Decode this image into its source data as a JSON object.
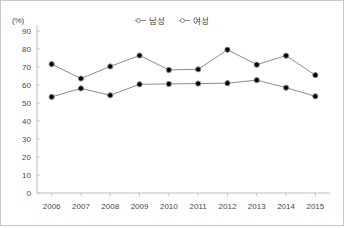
{
  "figure": {
    "unit_label": "(%)",
    "axis_color": "#bfbfbf",
    "series_color": "#8c8c8c",
    "border_color": "#c9c9c9"
  },
  "legend": {
    "position": "top-center",
    "entries": [
      {
        "label": "남성",
        "marker": "open-circle",
        "color": "#8c8c8c"
      },
      {
        "label": "여성",
        "marker": "open-circle",
        "color": "#8c8c8c"
      }
    ]
  },
  "chart_data": {
    "type": "line",
    "title": "",
    "xlabel": "",
    "ylabel": "(%)",
    "categories": [
      "2006",
      "2007",
      "2008",
      "2009",
      "2010",
      "2011",
      "2012",
      "2013",
      "2014",
      "2015"
    ],
    "x": [
      2006,
      2007,
      2008,
      2009,
      2010,
      2011,
      2012,
      2013,
      2014,
      2015
    ],
    "series": [
      {
        "name": "남성",
        "color": "#8c8c8c",
        "marker": "open-circle",
        "values": [
          71.6,
          63.6,
          70.3,
          76.4,
          68.4,
          68.7,
          79.6,
          71.3,
          76.3,
          65.5
        ]
      },
      {
        "name": "여성",
        "color": "#8c8c8c",
        "marker": "open-circle",
        "values": [
          53.4,
          58.1,
          54.3,
          60.4,
          60.6,
          60.8,
          61.0,
          62.7,
          58.5,
          53.7
        ]
      }
    ],
    "ylim": [
      0,
      90
    ],
    "yticks": [
      0,
      10,
      20,
      30,
      40,
      50,
      60,
      70,
      80,
      90
    ],
    "ytick_labels": [
      "0",
      "10",
      "20",
      "30",
      "40",
      "50",
      "60",
      "70",
      "80",
      "90"
    ],
    "grid": false,
    "legend_position": "top-center"
  }
}
